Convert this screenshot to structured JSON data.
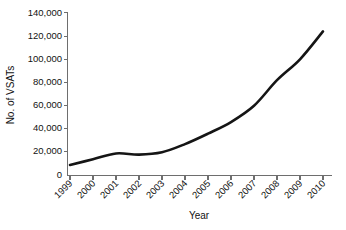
{
  "chart_data": {
    "type": "line",
    "title": "",
    "subtitle": "",
    "xlabel": "Year",
    "ylabel": "No. of VSATs",
    "x": [
      1999,
      2000,
      2001,
      2002,
      2003,
      2004,
      2005,
      2006,
      2007,
      2008,
      2009,
      2010
    ],
    "categories": [
      "1999",
      "2000",
      "2001",
      "2002",
      "2003",
      "2004",
      "2005",
      "2006",
      "2007",
      "2008",
      "2009",
      "2010"
    ],
    "values": [
      9000,
      14000,
      19000,
      18000,
      20000,
      27000,
      36000,
      46000,
      60000,
      82000,
      100000,
      124000
    ],
    "series": [
      {
        "name": "No. of VSATs",
        "values": [
          9000,
          14000,
          19000,
          18000,
          20000,
          27000,
          36000,
          46000,
          60000,
          82000,
          100000,
          124000
        ]
      }
    ],
    "xlim": [
      1999,
      2010
    ],
    "ylim": [
      0,
      140000
    ],
    "ytick_values": [
      0,
      20000,
      40000,
      60000,
      80000,
      100000,
      120000,
      140000
    ],
    "ytick_labels": [
      "0",
      "20,000",
      "40,000",
      "60,000",
      "80,000",
      "100,000",
      "120,000",
      "140,000"
    ],
    "xtick_labels": [
      "1999",
      "2000",
      "2001",
      "2002",
      "2003",
      "2004",
      "2005",
      "2006",
      "2007",
      "2008",
      "2009",
      "2010"
    ],
    "xtick_label_rotation_deg": 45,
    "grid": false,
    "legend": false,
    "legend_position": "none",
    "line_color": "#151515",
    "axis_color": "#6e6e6e",
    "background_color": "#ffffff",
    "annotations": []
  }
}
